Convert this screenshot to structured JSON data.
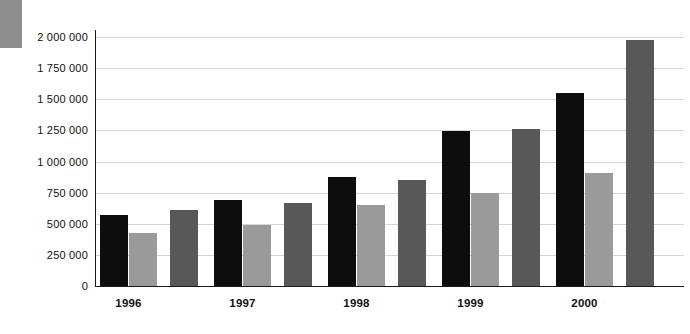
{
  "chart_data": {
    "type": "bar",
    "title": "",
    "xlabel": "",
    "ylabel": "",
    "categories": [
      "1996",
      "1997",
      "1998",
      "1999",
      "2000"
    ],
    "series": [
      {
        "name": "series-1",
        "color": "#0d0d0d",
        "values": [
          570000,
          690000,
          875000,
          1245000,
          1550000
        ]
      },
      {
        "name": "series-2",
        "color": "#9a9a9a",
        "values": [
          425000,
          490000,
          650000,
          745000,
          905000
        ]
      },
      {
        "name": "series-3",
        "color": "#585858",
        "values": [
          610000,
          665000,
          850000,
          1260000,
          1975000
        ]
      }
    ],
    "ylim": [
      0,
      2000000
    ],
    "ytick_labels": [
      "2 000 000",
      "1 750 000",
      "1 500 000",
      "1 250 000",
      "1 000 000",
      "750 000",
      "500 000",
      "250 000",
      "0"
    ],
    "ytick_values": [
      2000000,
      1750000,
      1500000,
      1250000,
      1000000,
      750000,
      500000,
      250000,
      0
    ],
    "grid": true,
    "legend": "none"
  },
  "decoration": {
    "corner_block_color": "#8e8e8e"
  }
}
